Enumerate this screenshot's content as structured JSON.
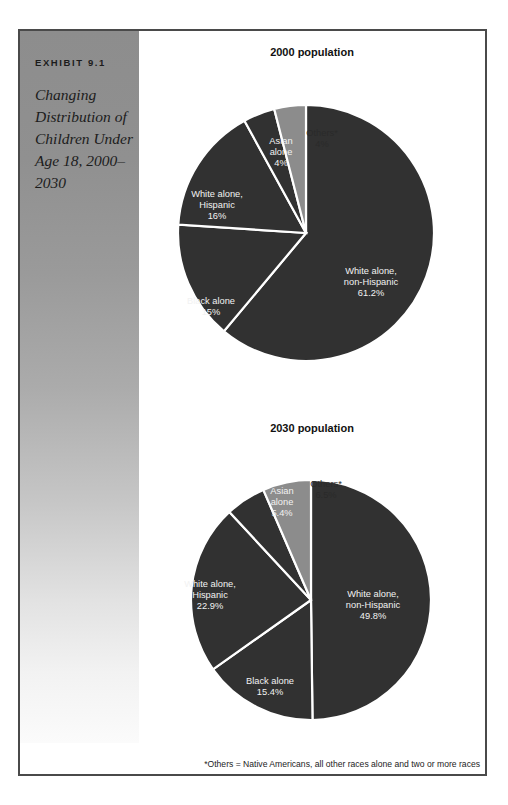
{
  "exhibit": {
    "label": "EXHIBIT 9.1",
    "title": "Changing Distribution of Children Under Age 18, 2000–2030"
  },
  "footnote": "*Others = Native Americans, all other races alone and two or more races",
  "colors": {
    "dark_slice": "#313131",
    "light_slice": "#8c8c8c",
    "slice_divider": "#ffffff",
    "frame_border": "#4a4a4a",
    "panel_top": "#8d8d8d",
    "panel_bottom": "#fbfbfb",
    "label_on_dark": "#f2f2f2",
    "label_on_light": "#2a2a2a"
  },
  "chart_data": [
    {
      "type": "pie",
      "id": "pie-2000",
      "title": "2000 population",
      "start_angle_deg": 0,
      "direction": "clockwise",
      "center": [
        167,
        193
      ],
      "radius": 128,
      "categories": [
        "White alone, non-Hispanic",
        "Black alone",
        "White alone, Hispanic",
        "Asian alone",
        "Others*"
      ],
      "values": [
        61.2,
        15,
        16,
        4,
        4
      ],
      "slices": [
        {
          "name": "White alone, non-Hispanic",
          "value": 61.2,
          "value_label": "61.2%",
          "lines": [
            "White alone,",
            "non-Hispanic",
            "61.2%"
          ],
          "shade": "dark",
          "label_pos": [
            232,
            243
          ]
        },
        {
          "name": "Black alone",
          "value": 15,
          "value_label": "15%",
          "lines": [
            "Black alone",
            "15%"
          ],
          "shade": "dark",
          "label_pos": [
            72,
            267
          ]
        },
        {
          "name": "White alone, Hispanic",
          "value": 16,
          "value_label": "16%",
          "lines": [
            "White alone,",
            "Hispanic",
            "16%"
          ],
          "shade": "dark",
          "label_pos": [
            78,
            166
          ]
        },
        {
          "name": "Asian alone",
          "value": 4,
          "value_label": "4%",
          "lines": [
            "Asian",
            "alone",
            "4%"
          ],
          "shade": "dark",
          "label_pos": [
            142,
            113
          ]
        },
        {
          "name": "Others*",
          "value": 4,
          "value_label": "4%",
          "lines": [
            "Others*",
            "4%"
          ],
          "shade": "light",
          "label_pos": [
            183,
            99
          ]
        }
      ]
    },
    {
      "type": "pie",
      "id": "pie-2030",
      "title": "2030 population",
      "start_angle_deg": 0,
      "direction": "clockwise",
      "center": [
        172,
        190
      ],
      "radius": 120,
      "categories": [
        "White alone, non-Hispanic",
        "Black alone",
        "White alone, Hispanic",
        "Asian alone",
        "Others*"
      ],
      "values": [
        49.8,
        15.4,
        22.9,
        5.4,
        6.5
      ],
      "slices": [
        {
          "name": "White alone, non-Hispanic",
          "value": 49.8,
          "value_label": "49.8%",
          "lines": [
            "White alone,",
            "non-Hispanic",
            "49.8%"
          ],
          "shade": "dark",
          "label_pos": [
            234,
            196
          ]
        },
        {
          "name": "Black alone",
          "value": 15.4,
          "value_label": "15.4%",
          "lines": [
            "Black alone",
            "15.4%"
          ],
          "shade": "dark",
          "label_pos": [
            131,
            277
          ]
        },
        {
          "name": "White alone, Hispanic",
          "value": 22.9,
          "value_label": "22.9%",
          "lines": [
            "White alone,",
            "Hispanic",
            "22.9%"
          ],
          "shade": "dark",
          "label_pos": [
            71,
            186
          ]
        },
        {
          "name": "Asian alone",
          "value": 5.4,
          "value_label": "5.4%",
          "lines": [
            "Asian",
            "alone",
            "5.4%"
          ],
          "shade": "dark",
          "label_pos": [
            143,
            93
          ]
        },
        {
          "name": "Others*",
          "value": 6.5,
          "value_label": "6.5%",
          "lines": [
            "Others*",
            "6.5%"
          ],
          "shade": "light",
          "label_pos": [
            187,
            80
          ]
        }
      ]
    }
  ]
}
